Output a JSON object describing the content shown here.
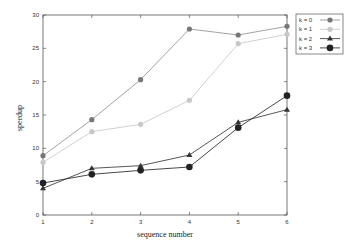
{
  "chart_data": {
    "type": "line",
    "title": "",
    "xlabel": "sequence number",
    "ylabel": "speedup",
    "x": [
      1,
      2,
      3,
      4,
      5,
      6
    ],
    "xticks": [
      "1",
      "2",
      "3",
      "4",
      "5",
      "6"
    ],
    "yticks": [
      "0",
      "5",
      "10",
      "15",
      "20",
      "25",
      "30"
    ],
    "xlim": [
      1,
      6
    ],
    "ylim": [
      0,
      30
    ],
    "grid": false,
    "legend_position": "outside-top-right",
    "series": [
      {
        "name": "k = 0",
        "values": [
          8.9,
          14.3,
          20.3,
          27.9,
          27.0,
          28.3
        ],
        "color": "#777777",
        "marker": "circle",
        "line": "#999999"
      },
      {
        "name": "k = 1",
        "values": [
          7.9,
          12.5,
          13.6,
          17.2,
          25.7,
          27.1
        ],
        "color": "#c8c8c8",
        "marker": "circle",
        "line": "#cccccc"
      },
      {
        "name": "k = 2",
        "values": [
          4.0,
          7.0,
          7.4,
          9.0,
          13.9,
          15.8
        ],
        "color": "#333333",
        "marker": "triangle",
        "line": "#444444"
      },
      {
        "name": "k = 3",
        "values": [
          4.8,
          6.1,
          6.7,
          7.2,
          13.1,
          17.9
        ],
        "color": "#222222",
        "marker": "circle-large",
        "line": "#333333"
      }
    ]
  }
}
